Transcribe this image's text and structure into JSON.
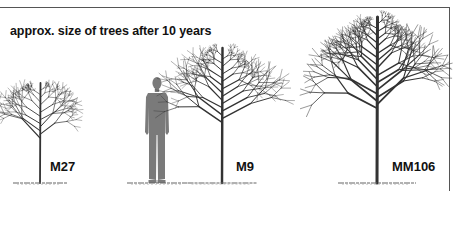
{
  "title": "approx. size of trees after 10 years",
  "figures": [
    {
      "kind": "tree",
      "label": "M27",
      "trunk_x": 40,
      "top_y": 83,
      "ground_y": 183,
      "crown_half_width": 36
    },
    {
      "kind": "person",
      "label": "",
      "center_x": 157,
      "top_y": 77,
      "ground_y": 183
    },
    {
      "kind": "tree",
      "label": "M9",
      "trunk_x": 222,
      "top_y": 48,
      "ground_y": 183,
      "crown_half_width": 46
    },
    {
      "kind": "tree",
      "label": "MM106",
      "trunk_x": 377,
      "top_y": 17,
      "ground_y": 183,
      "crown_half_width": 52
    }
  ],
  "colors": {
    "frame": "#555555",
    "branches": "#333333",
    "silhouette": "#7a7a7a",
    "ground": "#666666",
    "text": "#111111"
  }
}
